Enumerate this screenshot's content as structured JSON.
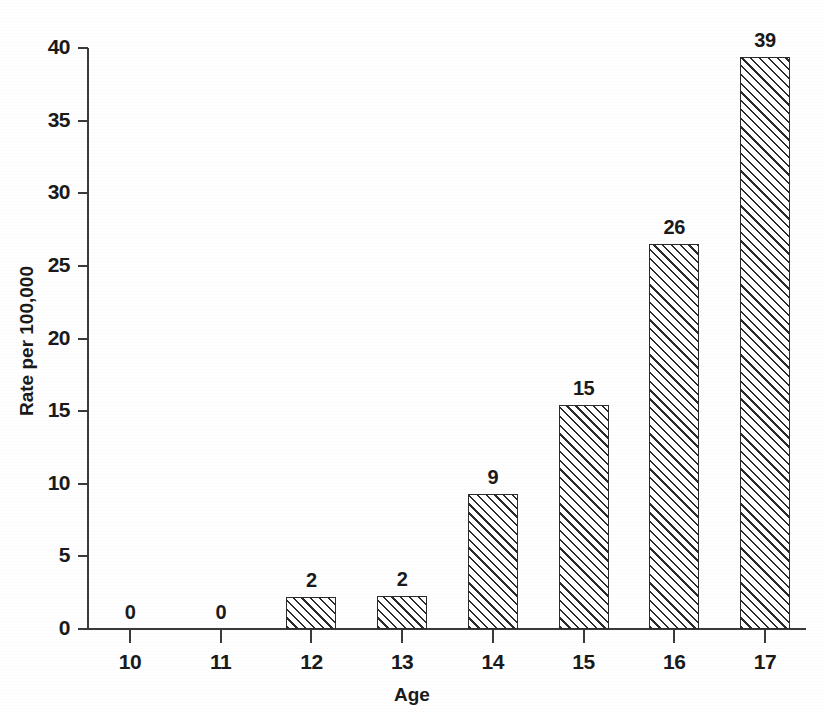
{
  "chart_data": {
    "type": "bar",
    "title": "",
    "xlabel": "Age",
    "ylabel": "Rate per 100,000",
    "categories": [
      "10",
      "11",
      "12",
      "13",
      "14",
      "15",
      "16",
      "17"
    ],
    "values": [
      0,
      0,
      2.2,
      2.3,
      9.3,
      15.4,
      26.5,
      39.4
    ],
    "data_labels": [
      "0",
      "0",
      "2",
      "2",
      "9",
      "15",
      "26",
      "39"
    ],
    "ylim": [
      0,
      40
    ],
    "yticks": [
      "0",
      "5",
      "10",
      "15",
      "20",
      "25",
      "30",
      "35",
      "40"
    ],
    "ytick_values": [
      0,
      5,
      10,
      15,
      20,
      25,
      30,
      35,
      40
    ],
    "grid": false,
    "legend": "none",
    "series": [
      {
        "name": "Rate per 100,000",
        "values": [
          0,
          0,
          2.2,
          2.3,
          9.3,
          15.4,
          26.5,
          39.4
        ]
      }
    ]
  },
  "style": {
    "bar_fill": "#ffffff",
    "bar_edge": "#2b2b2b",
    "hatch": "forward-diagonal",
    "axis_color": "#3a3a3a",
    "text_color": "#1a1a1a",
    "background": "#ffffff"
  }
}
